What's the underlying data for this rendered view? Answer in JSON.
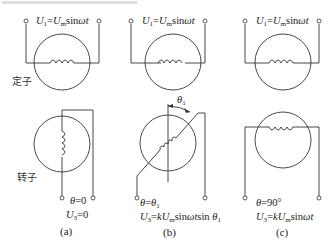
{
  "figure": {
    "panels": [
      {
        "id": "a",
        "caption": "(a)",
        "stator_formula": {
          "lhs": "U",
          "lhs_sub": "1",
          "eq": "=",
          "rhs": "U",
          "rhs_sub": "m",
          "tail": "sin",
          "tail_it": "ωt"
        },
        "theta_label": {
          "var": "θ",
          "rest": "=0"
        },
        "output_label": {
          "var": "U",
          "sub": "3",
          "rest": "=0"
        }
      },
      {
        "id": "b",
        "caption": "(b)",
        "stator_formula": {
          "lhs": "U",
          "lhs_sub": "1",
          "eq": "=",
          "rhs": "U",
          "rhs_sub": "m",
          "tail": "sin",
          "tail_it": "ωt"
        },
        "angle_marker": {
          "var": "θ",
          "sub": "1"
        },
        "theta_label": {
          "var": "θ",
          "rest": "=",
          "var2": "θ",
          "sub2": "1"
        },
        "output_label": {
          "var": "U",
          "sub": "3",
          "eq": "=",
          "k": "kU",
          "k_sub": "m",
          "tail": "sin",
          "tail_it": "ωt",
          "tail2": "sin ",
          "tail2_it": "θ",
          "tail2_sub": "1"
        }
      },
      {
        "id": "c",
        "caption": "(c)",
        "stator_formula": {
          "lhs": "U",
          "lhs_sub": "1",
          "eq": "=",
          "rhs": "U",
          "rhs_sub": "m",
          "tail": "sin",
          "tail_it": "ωt"
        },
        "theta_label": {
          "var": "θ",
          "rest": "=90°"
        },
        "output_label": {
          "var": "U",
          "sub": "3",
          "eq": "=",
          "k": "kU",
          "k_sub": "m",
          "tail": "sin",
          "tail_it": "ωt"
        }
      }
    ],
    "side_labels": {
      "stator": "定子",
      "rotor": "转子"
    }
  }
}
